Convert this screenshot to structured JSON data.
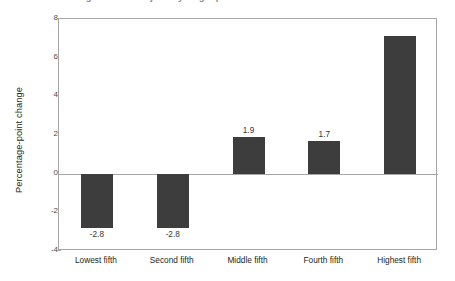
{
  "title_strip": {
    "clipped_title": "Change in share of jobs by wage quintile"
  },
  "chart_data": {
    "type": "bar",
    "title": "",
    "xlabel": "",
    "ylabel": "Percentage-point change",
    "categories": [
      "Lowest fifth",
      "Second fifth",
      "Middle fifth",
      "Fourth fifth",
      "Highest fifth"
    ],
    "values": [
      -2.8,
      -2.8,
      1.9,
      1.7,
      7.1
    ],
    "data_labels": [
      "-2.8",
      "-2.8",
      "1.9",
      "1.7",
      ""
    ],
    "ylim": [
      -4,
      8
    ],
    "ytick_labels": [
      "8",
      "6",
      "4",
      "2",
      "0",
      "-2",
      "-4"
    ],
    "ytick_values": [
      8,
      6,
      4,
      2,
      0,
      -2,
      -4
    ],
    "grid": false,
    "legend": "none",
    "bar_color": "#3d3d3d",
    "axis_color": "#a6a6a6",
    "zero_line": 0
  }
}
